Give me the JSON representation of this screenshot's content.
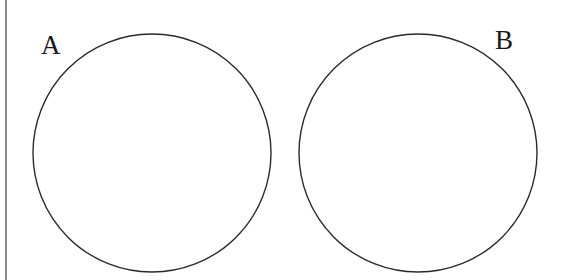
{
  "diagram": {
    "type": "venn",
    "sets": [
      {
        "label": "A",
        "cx": 152,
        "cy": 153,
        "r": 119,
        "label_x": 41,
        "label_y": 32
      },
      {
        "label": "B",
        "cx": 418,
        "cy": 153,
        "r": 119,
        "label_x": 495,
        "label_y": 27
      }
    ],
    "overlap": false
  },
  "colors": {
    "stroke": "#2a2a2a",
    "rule": "#8a8a8a",
    "background": "#ffffff"
  }
}
